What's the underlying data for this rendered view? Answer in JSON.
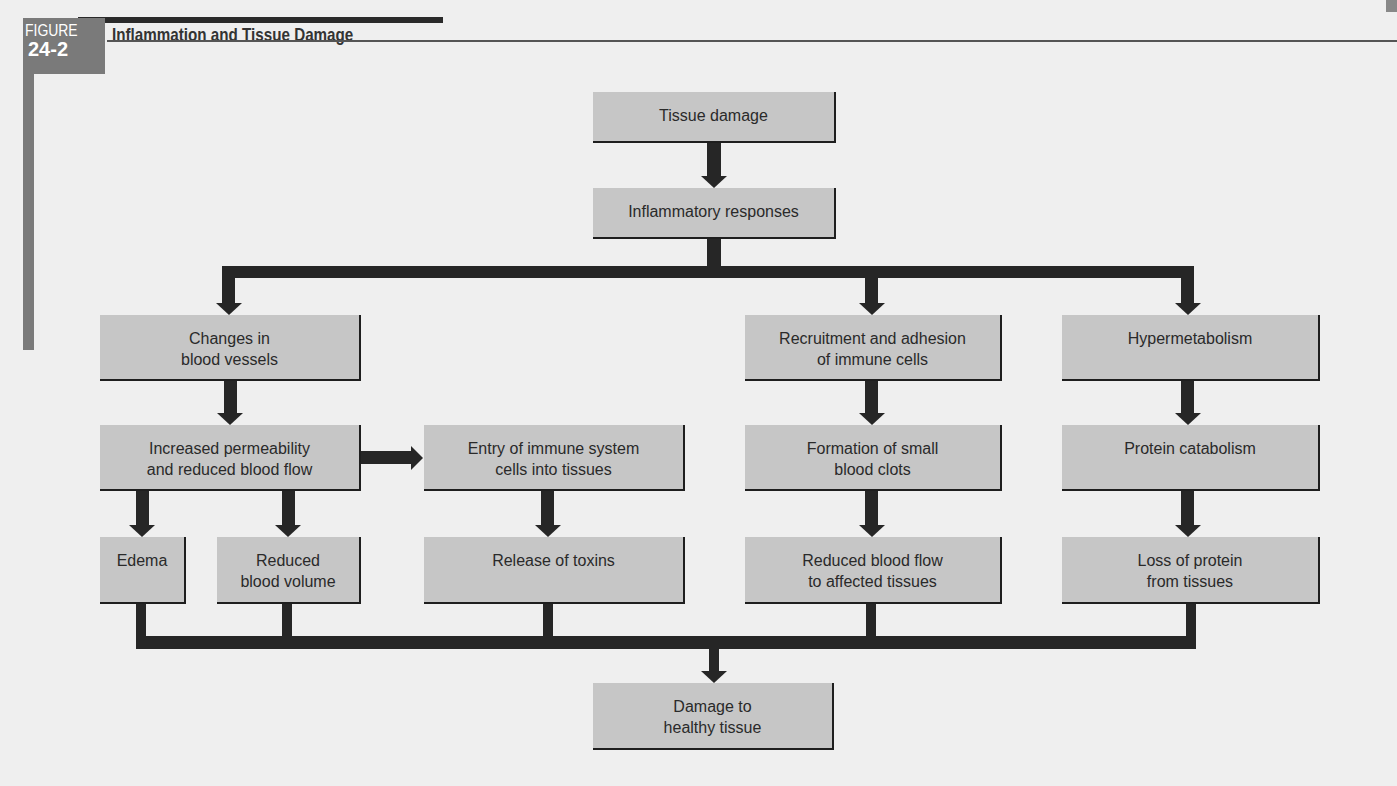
{
  "figure": {
    "label": "FIGURE",
    "number": "24-2",
    "title": "Inflammation and Tissue Damage"
  },
  "colors": {
    "background": "#efefef",
    "box_fill": "#c6c6c6",
    "arrow": "#262626",
    "badge": "#7a7a7a"
  },
  "nodes": {
    "tissue_damage": "Tissue damage",
    "inflammatory_responses": "Inflammatory responses",
    "changes_blood_vessels": "Changes in\nblood vessels",
    "recruitment_adhesion": "Recruitment and adhesion\nof immune cells",
    "hypermetabolism": "Hypermetabolism",
    "increased_permeability": "Increased permeability\nand reduced blood flow",
    "entry_immune_cells": "Entry of immune system\ncells into tissues",
    "formation_clots": "Formation of small\nblood clots",
    "protein_catabolism": "Protein catabolism",
    "edema": "Edema",
    "reduced_blood_volume": "Reduced\nblood volume",
    "release_toxins": "Release of toxins",
    "reduced_blood_flow": "Reduced blood flow\nto affected tissues",
    "loss_protein": "Loss of protein\nfrom tissues",
    "damage_healthy_tissue": "Damage to\nhealthy tissue"
  },
  "edges": [
    [
      "tissue_damage",
      "inflammatory_responses"
    ],
    [
      "inflammatory_responses",
      "changes_blood_vessels"
    ],
    [
      "inflammatory_responses",
      "recruitment_adhesion"
    ],
    [
      "inflammatory_responses",
      "hypermetabolism"
    ],
    [
      "changes_blood_vessels",
      "increased_permeability"
    ],
    [
      "increased_permeability",
      "entry_immune_cells"
    ],
    [
      "increased_permeability",
      "edema"
    ],
    [
      "increased_permeability",
      "reduced_blood_volume"
    ],
    [
      "entry_immune_cells",
      "release_toxins"
    ],
    [
      "recruitment_adhesion",
      "formation_clots"
    ],
    [
      "formation_clots",
      "reduced_blood_flow"
    ],
    [
      "hypermetabolism",
      "protein_catabolism"
    ],
    [
      "protein_catabolism",
      "loss_protein"
    ],
    [
      "edema",
      "damage_healthy_tissue"
    ],
    [
      "reduced_blood_volume",
      "damage_healthy_tissue"
    ],
    [
      "release_toxins",
      "damage_healthy_tissue"
    ],
    [
      "reduced_blood_flow",
      "damage_healthy_tissue"
    ],
    [
      "loss_protein",
      "damage_healthy_tissue"
    ]
  ]
}
